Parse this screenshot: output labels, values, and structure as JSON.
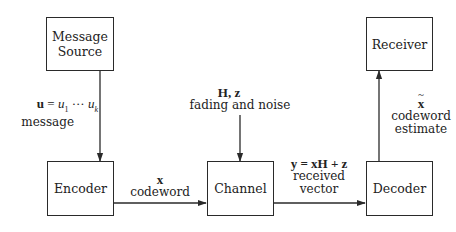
{
  "diagram": {
    "blocks": {
      "source": {
        "line1": "Message",
        "line2": "Source"
      },
      "encoder": {
        "label": "Encoder"
      },
      "channel": {
        "label": "Channel"
      },
      "decoder": {
        "label": "Decoder"
      },
      "receiver": {
        "label": "Receiver"
      }
    },
    "edges": {
      "source_to_encoder": {
        "math_lhs": "u",
        "math_eq": " = ",
        "math_rhs_1": "u",
        "sub_1": "1",
        "dots": " ··· ",
        "math_rhs_k": "u",
        "sub_k": "k",
        "text": "message"
      },
      "noise_to_channel": {
        "math": "H, z",
        "text": "fading and noise"
      },
      "encoder_to_channel": {
        "math": "x",
        "text": "codeword"
      },
      "channel_to_decoder": {
        "math": "y = xH + z",
        "text_1": "received",
        "text_2": "vector"
      },
      "decoder_to_receiver": {
        "math": "x",
        "text_1": "codeword",
        "text_2": "estimate"
      }
    },
    "colors": {
      "line": "#2a2a2a",
      "background": "#ffffff",
      "text": "#222222"
    }
  }
}
